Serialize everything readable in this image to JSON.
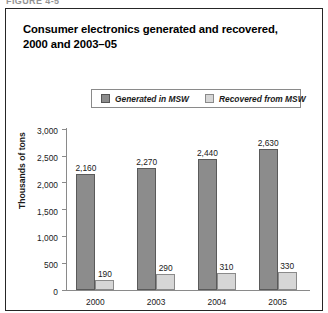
{
  "figure": {
    "label": "FIGURE 4-5",
    "title": "Consumer electronics generated and recovered, 2000 and 2003–05"
  },
  "legend": {
    "entries": [
      {
        "label": "Generated in MSW",
        "color": "#8c8c8c",
        "swatch": "generated"
      },
      {
        "label": "Recovered from MSW",
        "color": "#d6d6d6",
        "swatch": "recovered"
      }
    ]
  },
  "chart_data": {
    "type": "bar",
    "title": "Consumer electronics generated and recovered, 2000 and 2003–05",
    "xlabel": "",
    "ylabel": "Thousands of tons",
    "ylim": [
      0,
      3000
    ],
    "yticks": [
      0,
      500,
      1000,
      1500,
      2000,
      2500,
      3000
    ],
    "ytick_labels": [
      "0",
      "500",
      "1,000",
      "1,500",
      "2,000",
      "2,500",
      "3,000"
    ],
    "grid": false,
    "legend_position": "top-center",
    "categories": [
      "2000",
      "2003",
      "2004",
      "2005"
    ],
    "series": [
      {
        "name": "Generated in MSW",
        "color": "#8c8c8c",
        "values": [
          2160,
          2270,
          2440,
          2630
        ],
        "labels": [
          "2,160",
          "2,270",
          "2,440",
          "2,630"
        ]
      },
      {
        "name": "Recovered from MSW",
        "color": "#d6d6d6",
        "values": [
          190,
          290,
          310,
          330
        ],
        "labels": [
          "190",
          "290",
          "310",
          "330"
        ]
      }
    ]
  }
}
